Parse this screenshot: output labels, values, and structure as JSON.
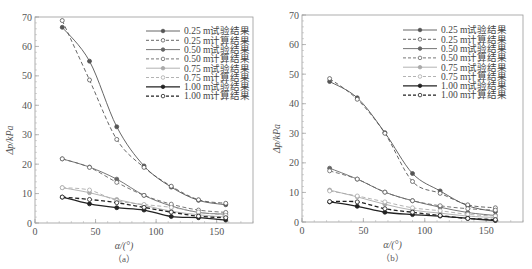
{
  "chart_data": [
    {
      "type": "line",
      "caption": "（a）",
      "xlabel": "α/(°)",
      "ylabel": "Δp/kPa",
      "xlim": [
        0,
        180
      ],
      "ylim": [
        0,
        70
      ],
      "xticks": [
        0,
        50,
        100,
        150
      ],
      "yticks": [
        0,
        10,
        20,
        30,
        40,
        50,
        60,
        70
      ],
      "grid": false,
      "legend_position": "upper right",
      "x": [
        22.5,
        45,
        67.5,
        90,
        112.5,
        135,
        157.5
      ],
      "series": [
        {
          "name": "0.25 m试验结果",
          "style": "solid",
          "marker": "filled",
          "color": "#555555",
          "values": [
            66.5,
            55.0,
            32.7,
            19.4,
            12.2,
            7.7,
            6.2
          ]
        },
        {
          "name": "0.25 m计算结果",
          "style": "dashed",
          "marker": "open",
          "color": "#555555",
          "values": [
            68.8,
            48.6,
            28.4,
            18.9,
            12.5,
            7.9,
            6.7
          ]
        },
        {
          "name": "0.50 m试验结果",
          "style": "solid",
          "marker": "filled",
          "color": "#666666",
          "values": [
            21.8,
            19.0,
            14.9,
            9.4,
            5.8,
            3.6,
            3.0
          ]
        },
        {
          "name": "0.50 m计算结果",
          "style": "dashed",
          "marker": "open",
          "color": "#666666",
          "values": [
            21.8,
            18.9,
            13.8,
            9.4,
            6.4,
            4.4,
            3.6
          ]
        },
        {
          "name": "0.75 m试验结果",
          "style": "solid",
          "marker": "filled",
          "color": "#aaaaaa",
          "values": [
            12.0,
            10.3,
            8.0,
            6.0,
            4.0,
            2.8,
            2.0
          ]
        },
        {
          "name": "0.75 m计算结果",
          "style": "dashed",
          "marker": "open",
          "color": "#aaaaaa",
          "values": [
            12.0,
            11.2,
            7.6,
            6.3,
            5.3,
            3.7,
            2.6
          ]
        },
        {
          "name": "1.00 m试验结果",
          "style": "solid",
          "marker": "filled",
          "color": "#222222",
          "values": [
            8.8,
            6.5,
            5.2,
            4.4,
            2.2,
            1.8,
            1.0
          ]
        },
        {
          "name": "1.00 m计算结果",
          "style": "dashed",
          "marker": "open",
          "color": "#222222",
          "values": [
            8.8,
            8.0,
            6.9,
            5.3,
            3.7,
            2.3,
            1.8
          ]
        }
      ]
    },
    {
      "type": "line",
      "caption": "（b）",
      "xlabel": "α/(°)",
      "ylabel": "Δp/kPa",
      "xlim": [
        0,
        180
      ],
      "ylim": [
        0,
        70
      ],
      "xticks": [
        0,
        50,
        100,
        150
      ],
      "yticks": [
        0,
        10,
        20,
        30,
        40,
        50,
        60,
        70
      ],
      "grid": false,
      "legend_position": "upper right",
      "x": [
        22.5,
        45,
        67.5,
        90,
        112.5,
        135,
        157.5
      ],
      "series": [
        {
          "name": "0.25 m试验结果",
          "style": "solid",
          "marker": "filled",
          "color": "#555555",
          "values": [
            47.5,
            42.0,
            30.2,
            16.4,
            10.5,
            5.5,
            3.5
          ]
        },
        {
          "name": "0.25 m计算结果",
          "style": "dashed",
          "marker": "open",
          "color": "#555555",
          "values": [
            48.5,
            41.5,
            30.0,
            13.7,
            9.7,
            5.8,
            4.8
          ]
        },
        {
          "name": "0.50 m试验结果",
          "style": "solid",
          "marker": "filled",
          "color": "#666666",
          "values": [
            18.2,
            14.5,
            10.1,
            7.2,
            5.0,
            3.2,
            2.2
          ]
        },
        {
          "name": "0.50 m计算结果",
          "style": "dashed",
          "marker": "open",
          "color": "#666666",
          "values": [
            17.3,
            14.5,
            10.1,
            7.2,
            5.5,
            4.5,
            4.0
          ]
        },
        {
          "name": "0.75 m试验结果",
          "style": "solid",
          "marker": "filled",
          "color": "#aaaaaa",
          "values": [
            10.8,
            8.5,
            6.0,
            4.0,
            3.0,
            2.0,
            1.5
          ]
        },
        {
          "name": "0.75 m计算结果",
          "style": "dashed",
          "marker": "open",
          "color": "#aaaaaa",
          "values": [
            10.5,
            8.8,
            6.8,
            4.8,
            3.8,
            2.6,
            2.0
          ]
        },
        {
          "name": "1.00 m试验结果",
          "style": "solid",
          "marker": "filled",
          "color": "#222222",
          "values": [
            6.8,
            5.3,
            3.3,
            2.5,
            2.0,
            1.2,
            0.5
          ]
        },
        {
          "name": "1.00 m计算结果",
          "style": "dashed",
          "marker": "open",
          "color": "#222222",
          "values": [
            6.9,
            6.8,
            4.5,
            3.3,
            2.2,
            1.2,
            0.8
          ]
        }
      ]
    }
  ]
}
